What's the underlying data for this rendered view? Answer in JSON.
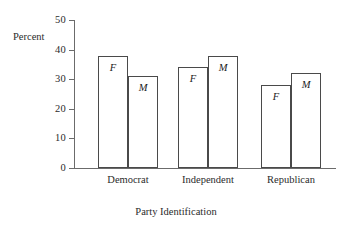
{
  "chart_data": {
    "type": "bar",
    "title": "",
    "xlabel": "Party Identification",
    "ylabel": "Percent",
    "categories": [
      "Democrat",
      "Independent",
      "Republican"
    ],
    "series": [
      {
        "name": "F",
        "values": [
          38,
          34,
          28
        ]
      },
      {
        "name": "M",
        "values": [
          31,
          38,
          32
        ]
      }
    ],
    "bar_labels": [
      [
        "F",
        "M"
      ],
      [
        "F",
        "M"
      ],
      [
        "F",
        "M"
      ]
    ],
    "ylim": [
      0,
      50
    ],
    "yticks": [
      0,
      10,
      20,
      30,
      40,
      50
    ],
    "ytick_labels": [
      "0",
      "10",
      "20",
      "30",
      "40",
      "50"
    ],
    "grid": false,
    "legend": "none",
    "bar_style": {
      "fill": "#ffffff",
      "outline": "#4a4a4a"
    },
    "axis_color": "#6b6b6b",
    "text_color": "#2b2b2b"
  }
}
